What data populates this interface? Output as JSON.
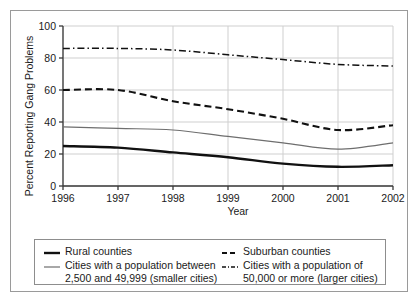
{
  "chart_data": {
    "type": "line",
    "title": "",
    "xlabel": "Year",
    "ylabel": "Percent Reporting Gang Problems",
    "x": [
      1996,
      1997,
      1998,
      1999,
      2000,
      2001,
      2002
    ],
    "xtick_labels": [
      "1996",
      "1997",
      "1998",
      "1999",
      "2000",
      "2001",
      "2002"
    ],
    "ytick_labels": [
      "0",
      "20",
      "40",
      "60",
      "80",
      "100"
    ],
    "yticks": [
      0,
      20,
      40,
      60,
      80,
      100
    ],
    "xlim": [
      1996,
      2002
    ],
    "ylim": [
      0,
      100
    ],
    "grid": true,
    "legend_position": "below-plot",
    "series": [
      {
        "name": "Rural counties",
        "style": "solid-thick",
        "color": "#111111",
        "values": [
          25,
          24,
          21,
          18,
          14,
          12,
          13
        ]
      },
      {
        "name": "Cities with a population between\n2,500 and 49,999 (smaller cities)",
        "style": "solid-thin",
        "color": "#6e6e6e",
        "values": [
          37,
          36,
          35,
          31,
          27,
          23,
          27
        ]
      },
      {
        "name": "Suburban counties",
        "style": "dashed",
        "color": "#111111",
        "values": [
          60,
          60,
          53,
          48,
          42,
          35,
          38
        ]
      },
      {
        "name": "Cities with a population of\n50,000 or more (larger cities)",
        "style": "dash-dot",
        "color": "#111111",
        "values": [
          86,
          86,
          85,
          82,
          79,
          76,
          75
        ]
      }
    ]
  },
  "legend": {
    "left_entries": [
      0,
      1
    ],
    "right_entries": [
      2,
      3
    ]
  },
  "colors": {
    "grid": "#cfcfcf",
    "axis": "#3a3a3a",
    "frame": "#9a9a9a",
    "text": "#1a1a1a"
  }
}
